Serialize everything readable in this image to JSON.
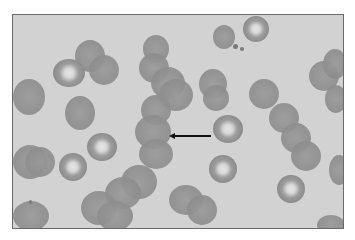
{
  "image": {
    "subject": "micrograph of red blood cells",
    "background_color": "#d2d2d2",
    "border_color": "#6a6a6a",
    "annotation": {
      "type": "arrow",
      "direction": "left",
      "color": "#111111"
    }
  },
  "cells": [
    {
      "x": 62,
      "y": 25,
      "w": 30,
      "h": 32,
      "kind": "solid"
    },
    {
      "x": 76,
      "y": 40,
      "w": 30,
      "h": 30,
      "kind": "solid"
    },
    {
      "x": 40,
      "y": 44,
      "w": 32,
      "h": 28,
      "kind": "ring"
    },
    {
      "x": 0,
      "y": 64,
      "w": 32,
      "h": 36,
      "kind": "solid"
    },
    {
      "x": 52,
      "y": 81,
      "w": 30,
      "h": 34,
      "kind": "solid"
    },
    {
      "x": 130,
      "y": 20,
      "w": 26,
      "h": 28,
      "kind": "solid"
    },
    {
      "x": 126,
      "y": 38,
      "w": 30,
      "h": 30,
      "kind": "solid"
    },
    {
      "x": 138,
      "y": 52,
      "w": 34,
      "h": 32,
      "kind": "solid"
    },
    {
      "x": 146,
      "y": 64,
      "w": 34,
      "h": 32,
      "kind": "solid"
    },
    {
      "x": 128,
      "y": 80,
      "w": 30,
      "h": 30,
      "kind": "solid"
    },
    {
      "x": 122,
      "y": 100,
      "w": 36,
      "h": 34,
      "kind": "solid"
    },
    {
      "x": 126,
      "y": 124,
      "w": 34,
      "h": 30,
      "kind": "solid"
    },
    {
      "x": 186,
      "y": 54,
      "w": 28,
      "h": 30,
      "kind": "solid"
    },
    {
      "x": 190,
      "y": 70,
      "w": 26,
      "h": 26,
      "kind": "solid"
    },
    {
      "x": 200,
      "y": 100,
      "w": 30,
      "h": 28,
      "kind": "ring"
    },
    {
      "x": 230,
      "y": 1,
      "w": 26,
      "h": 26,
      "kind": "ring"
    },
    {
      "x": 200,
      "y": 10,
      "w": 22,
      "h": 24,
      "kind": "solid"
    },
    {
      "x": 236,
      "y": 64,
      "w": 30,
      "h": 30,
      "kind": "solid"
    },
    {
      "x": 256,
      "y": 88,
      "w": 30,
      "h": 30,
      "kind": "solid"
    },
    {
      "x": 268,
      "y": 108,
      "w": 30,
      "h": 30,
      "kind": "solid"
    },
    {
      "x": 278,
      "y": 126,
      "w": 30,
      "h": 30,
      "kind": "solid"
    },
    {
      "x": 296,
      "y": 46,
      "w": 30,
      "h": 30,
      "kind": "solid"
    },
    {
      "x": 310,
      "y": 34,
      "w": 24,
      "h": 30,
      "kind": "solid"
    },
    {
      "x": 312,
      "y": 70,
      "w": 22,
      "h": 28,
      "kind": "solid"
    },
    {
      "x": 316,
      "y": 140,
      "w": 20,
      "h": 30,
      "kind": "solid"
    },
    {
      "x": 0,
      "y": 130,
      "w": 34,
      "h": 34,
      "kind": "solid"
    },
    {
      "x": 12,
      "y": 132,
      "w": 30,
      "h": 30,
      "kind": "solid"
    },
    {
      "x": 46,
      "y": 138,
      "w": 28,
      "h": 28,
      "kind": "ring"
    },
    {
      "x": 74,
      "y": 118,
      "w": 30,
      "h": 28,
      "kind": "ring"
    },
    {
      "x": 108,
      "y": 150,
      "w": 36,
      "h": 34,
      "kind": "solid"
    },
    {
      "x": 92,
      "y": 162,
      "w": 36,
      "h": 32,
      "kind": "solid"
    },
    {
      "x": 68,
      "y": 176,
      "w": 36,
      "h": 34,
      "kind": "solid"
    },
    {
      "x": 84,
      "y": 186,
      "w": 36,
      "h": 30,
      "kind": "solid"
    },
    {
      "x": 0,
      "y": 186,
      "w": 36,
      "h": 30,
      "kind": "solid"
    },
    {
      "x": 156,
      "y": 170,
      "w": 34,
      "h": 30,
      "kind": "solid"
    },
    {
      "x": 174,
      "y": 180,
      "w": 30,
      "h": 30,
      "kind": "solid"
    },
    {
      "x": 196,
      "y": 140,
      "w": 28,
      "h": 28,
      "kind": "ring"
    },
    {
      "x": 264,
      "y": 160,
      "w": 28,
      "h": 28,
      "kind": "ring"
    },
    {
      "x": 304,
      "y": 200,
      "w": 28,
      "h": 20,
      "kind": "solid"
    }
  ],
  "dots": [
    {
      "x": 220,
      "y": 29,
      "w": 5,
      "h": 5
    },
    {
      "x": 227,
      "y": 32,
      "w": 4,
      "h": 4
    },
    {
      "x": 16,
      "y": 185,
      "w": 3,
      "h": 4
    }
  ],
  "arrow": {
    "x1": 168,
    "x2": 210,
    "y": 134
  }
}
